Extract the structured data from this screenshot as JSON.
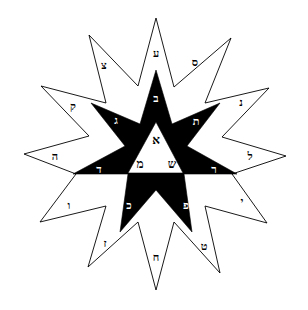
{
  "figure": {
    "title": "",
    "colors": {
      "ink": "#000000",
      "paper": "#ffffff"
    },
    "outer_star": {
      "points": 12,
      "letters": [
        {
          "id": "top",
          "char": "ע",
          "x": 156,
          "y": 57
        },
        {
          "id": "nne",
          "char": "ס",
          "x": 195,
          "y": 66
        },
        {
          "id": "ne",
          "char": "נ",
          "x": 241,
          "y": 106
        },
        {
          "id": "e",
          "char": "ל",
          "x": 250,
          "y": 157
        },
        {
          "id": "ese",
          "char": "י",
          "x": 242,
          "y": 203
        },
        {
          "id": "se",
          "char": "ט",
          "x": 204,
          "y": 248
        },
        {
          "id": "s",
          "char": "ח",
          "x": 156,
          "y": 260
        },
        {
          "id": "ssw",
          "char": "ז",
          "x": 105,
          "y": 245
        },
        {
          "id": "sw",
          "char": "ו",
          "x": 69,
          "y": 207
        },
        {
          "id": "w",
          "char": "ה",
          "x": 55,
          "y": 158
        },
        {
          "id": "wnw",
          "char": "ק",
          "x": 73,
          "y": 108
        },
        {
          "id": "nw",
          "char": "צ",
          "x": 104,
          "y": 67
        }
      ]
    },
    "inner_star": {
      "letters": [
        {
          "id": "top",
          "char": "ב",
          "x": 156,
          "y": 100
        },
        {
          "id": "upper-right",
          "char": "ת",
          "x": 196,
          "y": 123
        },
        {
          "id": "right",
          "char": "ר",
          "x": 214,
          "y": 171
        },
        {
          "id": "lower-right",
          "char": "פ",
          "x": 186,
          "y": 207
        },
        {
          "id": "lower-left",
          "char": "כ",
          "x": 129,
          "y": 207
        },
        {
          "id": "left",
          "char": "ד",
          "x": 99,
          "y": 171
        },
        {
          "id": "upper-left",
          "char": "ג",
          "x": 116,
          "y": 122
        }
      ]
    },
    "center_triangle": {
      "letters": [
        {
          "id": "apex",
          "char": "א",
          "x": 156,
          "y": 142
        },
        {
          "id": "base-left",
          "char": "מ",
          "x": 140,
          "y": 167
        },
        {
          "id": "base-right",
          "char": "ש",
          "x": 172,
          "y": 167
        }
      ]
    }
  }
}
